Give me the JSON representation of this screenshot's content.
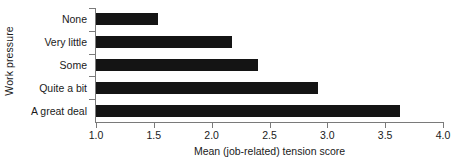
{
  "chart_data": {
    "type": "bar",
    "orientation": "horizontal",
    "title": "",
    "xlabel": "Mean (job-related) tension score",
    "ylabel": "Work pressure",
    "categories": [
      "None",
      "Very little",
      "Some",
      "Quite a bit",
      "A great deal"
    ],
    "values": [
      1.54,
      2.18,
      2.4,
      2.92,
      3.63
    ],
    "xlim": [
      1.0,
      4.0
    ],
    "xticks": [
      1.0,
      1.5,
      2.0,
      2.5,
      3.0,
      3.5,
      4.0
    ],
    "xtick_labels": [
      "1.0",
      "1.5",
      "2.0",
      "2.5",
      "3.0",
      "3.5",
      "4.0"
    ],
    "grid": false,
    "legend": null,
    "bar_color": "#141414",
    "axis_color": "#7a7a7a",
    "background": "#ffffff"
  }
}
